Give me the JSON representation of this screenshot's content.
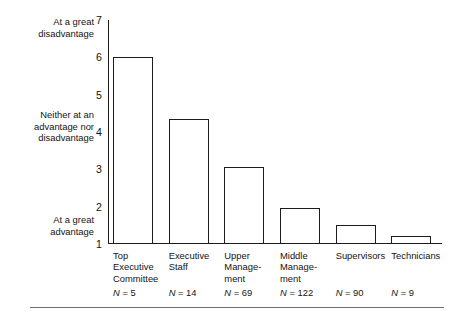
{
  "chart_data": {
    "type": "bar",
    "title": "",
    "subtitle": "",
    "xlabel": "",
    "ylabel": "",
    "ylim": [
      1,
      7
    ],
    "yticks": [
      1,
      2,
      3,
      4,
      5,
      6,
      7
    ],
    "ytick_labels": [
      "1",
      "2",
      "3",
      "4",
      "5",
      "6",
      "7"
    ],
    "grid": false,
    "legend": "none",
    "scale_anchors": [
      {
        "value": 7,
        "label": "At a great disadvantage"
      },
      {
        "value": 4,
        "label": "Neither at an advantage nor disadvantage"
      },
      {
        "value": 1,
        "label": "At a great advantage"
      }
    ],
    "categories": [
      "Top Executive Committee",
      "Executive Staff",
      "Upper Management",
      "Middle Management",
      "Supervisors",
      "Technicians"
    ],
    "values": [
      6.0,
      4.35,
      3.05,
      1.97,
      1.52,
      1.22
    ],
    "n_values": [
      5,
      14,
      69,
      122,
      90,
      9
    ],
    "bar_style": {
      "fill": "#ffffff",
      "edge": "#1c1c1c"
    }
  },
  "axis": {
    "tick_7": "7",
    "tick_6": "6",
    "tick_5": "5",
    "tick_4": "4",
    "tick_3": "3",
    "tick_2": "2",
    "tick_1": "1"
  },
  "anchors": {
    "top_line1": "At a great",
    "top_line2": "disadvantage",
    "middle_line1": "Neither at an",
    "middle_line2": "advantage nor",
    "middle_line3": "disadvantage",
    "bottom_line1": "At a great",
    "bottom_line2": "advantage"
  },
  "categories": [
    {
      "lines": [
        "Top",
        "Executive",
        "Committee"
      ],
      "line1": "Top",
      "line2": "Executive",
      "line3": "Committee",
      "n_label": "N = 5"
    },
    {
      "lines": [
        "Executive",
        "Staff"
      ],
      "line1": "Executive",
      "line2": "Staff",
      "line3": "",
      "n_label": "N = 14"
    },
    {
      "lines": [
        "Upper",
        "Manage-",
        "ment"
      ],
      "line1": "Upper",
      "line2": "Manage-",
      "line3": "ment",
      "n_label": "N = 69"
    },
    {
      "lines": [
        "Middle",
        "Manage-",
        "ment"
      ],
      "line1": "Middle",
      "line2": "Manage-",
      "line3": "ment",
      "n_label": "N = 122"
    },
    {
      "lines": [
        "Supervisors"
      ],
      "line1": "Supervisors",
      "line2": "",
      "line3": "",
      "n_label": "N = 90"
    },
    {
      "lines": [
        "Technicians"
      ],
      "line1": "Technicians",
      "line2": "",
      "line3": "",
      "n_label": "N = 9"
    }
  ]
}
